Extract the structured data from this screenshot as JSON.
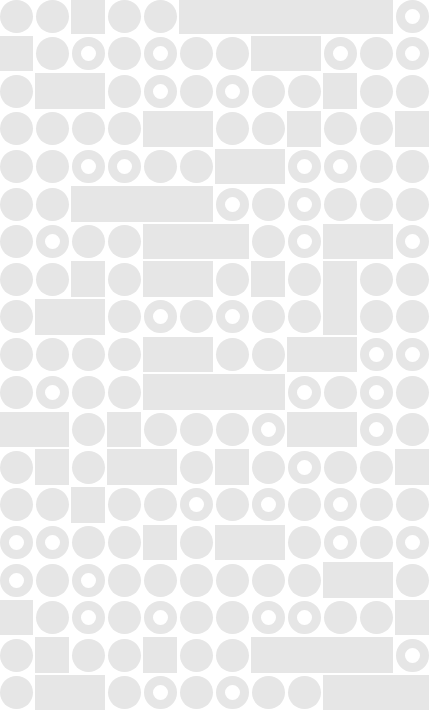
{
  "pattern": {
    "description": "Light gray geometric tile pattern of circles, rings and rectangles on white",
    "colors": {
      "background": "#ffffff",
      "shape": "#e6e6e6"
    },
    "grid": {
      "columns": 12,
      "rows": 19,
      "cell_width": 36,
      "cell_height": 37.6,
      "origin_x": -2,
      "origin_y": -2.8,
      "shape_diameter": 33,
      "ring_thickness": 9
    },
    "legend": {
      "C": "circle",
      "R": "ring",
      "S": "square",
      ".": "covered by rectangle"
    },
    "cells": [
      "CCSCC......R",
      "SCRCRCC..RCR",
      "C..CRCRCCSCC",
      "CCCC..CCSCCS",
      "CCRRCC..RRCC",
      "CC....RCRCCC",
      "CRCC...CR..R",
      "CCSC..CSC.CC",
      "C..CRCRCC.CC",
      "CCCC..CC..RR",
      "CRCC....RCRC",
      "..CSCCCR..RC",
      "CSC..CSCRCCS",
      "CCSCCRCRCRCC",
      "RRCCSC..CRCR",
      "RCRCCCCCC..C",
      "SCRCRCCRRCCS",
      "CSCCSCC....R",
      "C..CRCRCC..."
    ],
    "rectangles": [
      {
        "row": 0,
        "col": 5,
        "colspan": 6,
        "rowspan": 1
      },
      {
        "row": 1,
        "col": 7,
        "colspan": 2,
        "rowspan": 1
      },
      {
        "row": 2,
        "col": 1,
        "colspan": 2,
        "rowspan": 1
      },
      {
        "row": 3,
        "col": 4,
        "colspan": 2,
        "rowspan": 1
      },
      {
        "row": 4,
        "col": 6,
        "colspan": 2,
        "rowspan": 1
      },
      {
        "row": 5,
        "col": 2,
        "colspan": 4,
        "rowspan": 1
      },
      {
        "row": 6,
        "col": 4,
        "colspan": 3,
        "rowspan": 1
      },
      {
        "row": 6,
        "col": 9,
        "colspan": 2,
        "rowspan": 1
      },
      {
        "row": 7,
        "col": 4,
        "colspan": 2,
        "rowspan": 1
      },
      {
        "row": 7,
        "col": 9,
        "colspan": 1,
        "rowspan": 2
      },
      {
        "row": 8,
        "col": 1,
        "colspan": 2,
        "rowspan": 1
      },
      {
        "row": 9,
        "col": 4,
        "colspan": 2,
        "rowspan": 1
      },
      {
        "row": 9,
        "col": 8,
        "colspan": 2,
        "rowspan": 1
      },
      {
        "row": 10,
        "col": 4,
        "colspan": 4,
        "rowspan": 1
      },
      {
        "row": 11,
        "col": 0,
        "colspan": 2,
        "rowspan": 1
      },
      {
        "row": 11,
        "col": 8,
        "colspan": 2,
        "rowspan": 1
      },
      {
        "row": 12,
        "col": 3,
        "colspan": 2,
        "rowspan": 1
      },
      {
        "row": 14,
        "col": 6,
        "colspan": 2,
        "rowspan": 1
      },
      {
        "row": 15,
        "col": 9,
        "colspan": 2,
        "rowspan": 1
      },
      {
        "row": 17,
        "col": 7,
        "colspan": 4,
        "rowspan": 1
      },
      {
        "row": 18,
        "col": 1,
        "colspan": 2,
        "rowspan": 1
      },
      {
        "row": 18,
        "col": 9,
        "colspan": 3,
        "rowspan": 1
      }
    ]
  }
}
